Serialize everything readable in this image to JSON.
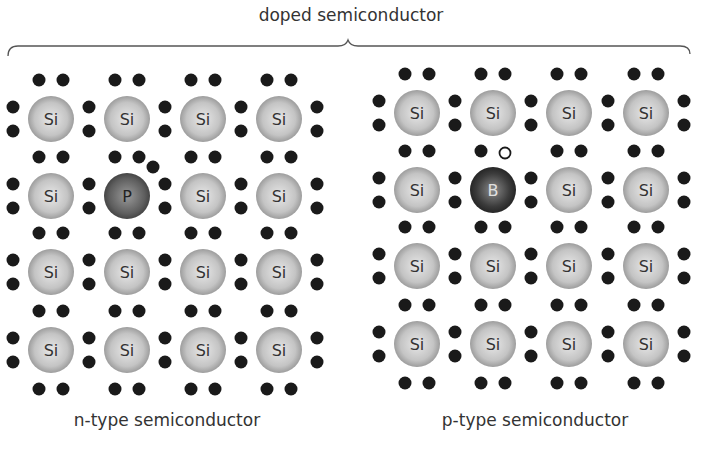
{
  "title": "doped semiconductor",
  "colors": {
    "electron": "#1a1a1a",
    "si_atom": "#bdbdbd",
    "dopant_atom": "#555555",
    "text": "#333333"
  },
  "lattices": [
    {
      "name": "n-type",
      "caption": "n-type semiconductor",
      "caption_x": 17,
      "cols": [
        51,
        127,
        203,
        279
      ],
      "rows": [
        119,
        196,
        272,
        350
      ],
      "atoms": [
        [
          "Si",
          "Si",
          "Si",
          "Si"
        ],
        [
          "Si",
          "P",
          "Si",
          "Si"
        ],
        [
          "Si",
          "Si",
          "Si",
          "Si"
        ],
        [
          "Si",
          "Si",
          "Si",
          "Si"
        ]
      ],
      "dopant": {
        "row": 1,
        "col": 1,
        "label": "P",
        "extra_electron": [
          153,
          167
        ]
      }
    },
    {
      "name": "p-type",
      "caption": "p-type semiconductor",
      "caption_x": 385,
      "cols": [
        417,
        493,
        569,
        646
      ],
      "rows": [
        113,
        190,
        266,
        344
      ],
      "atoms": [
        [
          "Si",
          "Si",
          "Si",
          "Si"
        ],
        [
          "Si",
          "B",
          "Si",
          "Si"
        ],
        [
          "Si",
          "Si",
          "Si",
          "Si"
        ],
        [
          "Si",
          "Si",
          "Si",
          "Si"
        ]
      ],
      "dopant": {
        "row": 1,
        "col": 1,
        "label": "B",
        "hole": [
          505,
          153
        ]
      }
    }
  ]
}
